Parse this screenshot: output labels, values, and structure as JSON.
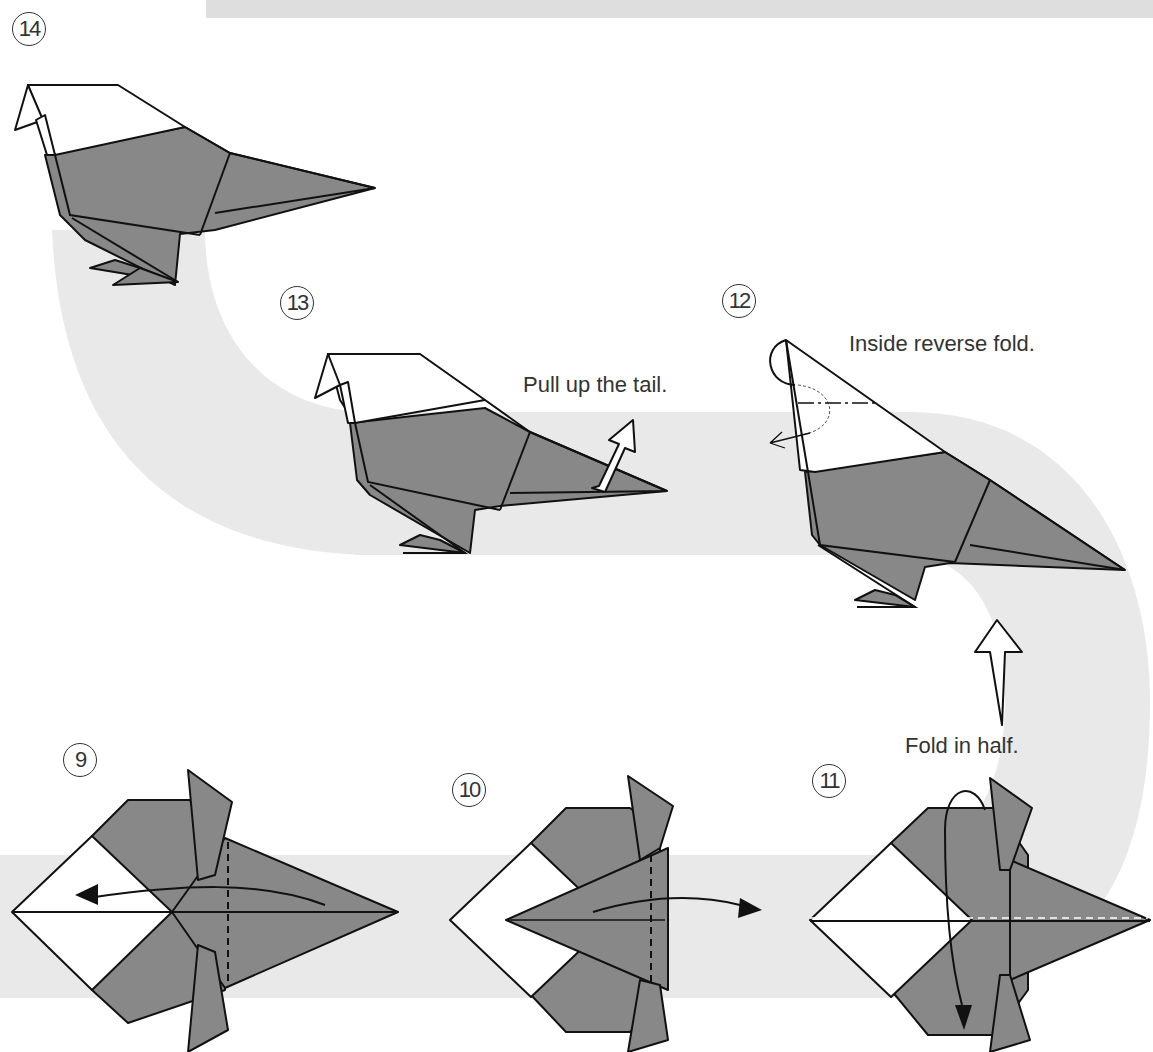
{
  "page": {
    "colors": {
      "background": "#ffffff",
      "band": "#e9e9e9",
      "top_strip": "#dedede",
      "paper_colored_side": "#888888",
      "paper_white_side": "#ffffff",
      "outline": "#111111",
      "text": "#333333"
    }
  },
  "steps": [
    {
      "number": "14",
      "caption": "",
      "description": "Finished bird"
    },
    {
      "number": "13",
      "caption": "Pull up the tail.",
      "arrow": "hollow-arrow-up-right"
    },
    {
      "number": "12",
      "caption": "Inside reverse fold.",
      "arrow": "reverse-fold-arrow"
    },
    {
      "number": "11",
      "caption": "Fold in half.",
      "arrow": "hollow-arrow-up"
    },
    {
      "number": "10",
      "caption": "",
      "arrow": "fold-right-arrow"
    },
    {
      "number": "9",
      "caption": "",
      "arrow": "fold-left-arrow"
    }
  ],
  "labels": {
    "step14": "14",
    "step13": "13",
    "step12": "12",
    "step11": "11",
    "step10": "10",
    "step9": "9",
    "caption13": "Pull up the tail.",
    "caption12": "Inside reverse fold.",
    "caption11": "Fold in half."
  }
}
